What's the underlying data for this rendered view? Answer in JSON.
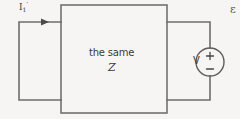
{
  "diagram": {
    "background_color": "#f6f5f3",
    "line_color": "#6f6d6b",
    "text_color": "#3d3b39",
    "labels": {
      "current": "I",
      "current_subscript": "1",
      "current_prime": "′",
      "box_line1": "the same",
      "box_line2": "Z",
      "source": "V",
      "source_plus": "+",
      "source_minus": "−",
      "corner_partial": "ε"
    },
    "elements": {
      "left_loop_name": "left-wire-loop",
      "center_box_name": "impedance-box",
      "right_loop_name": "right-wire-loop",
      "source_name": "voltage-source",
      "arrow_name": "current-arrow"
    }
  }
}
